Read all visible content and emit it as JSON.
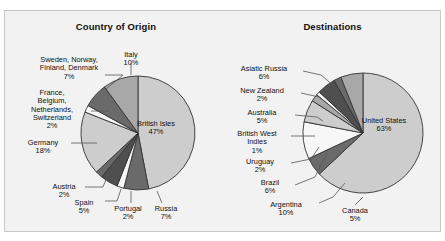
{
  "figure": {
    "background": "#f2f2f2",
    "border_color": "#c9c9c9",
    "page_background": "#ffffff"
  },
  "palette": {
    "light": "#cdcdcd",
    "mid": "#a8a8a8",
    "dark": "#6a6a6a",
    "darker": "#4f4f4f",
    "white": "#f7f7f7",
    "outline": "#333333",
    "leader": "#555555"
  },
  "charts": [
    {
      "id": "country-of-origin",
      "title": "Country of Origin",
      "chart_data": {
        "type": "pie",
        "title": "Country of Origin",
        "unit": "%",
        "start_angle_deg": 0,
        "direction": "clockwise",
        "legend": "none",
        "categories": [
          "British Isles",
          "Russia",
          "Portugal",
          "Spain",
          "Austria",
          "Germany",
          "France, Belgium, Netherlands, Switzerland",
          "Sweden, Norway, Finland, Denmark",
          "Italy"
        ],
        "values": [
          47,
          7,
          2,
          5,
          2,
          18,
          2,
          7,
          10
        ],
        "labels": [
          "British Isles\n47%",
          "Russia\n7%",
          "Portugal\n2%",
          "Spain\n5%",
          "Austria\n2%",
          "Germany\n18%",
          "France,\nBelgium,\nNetherlands,\nSwitzerland\n2%",
          "Sweden, Norway,\nFinland, Denmark\n7%",
          "Italy\n10%"
        ],
        "colors": [
          "#cdcdcd",
          "#6a6a6a",
          "#f7f7f7",
          "#4f4f4f",
          "#6a6a6a",
          "#cdcdcd",
          "#f7f7f7",
          "#6a6a6a",
          "#a8a8a8"
        ]
      },
      "slice_labels": [
        {
          "name": "british-isles",
          "text": "British Isles\n47%"
        },
        {
          "name": "russia",
          "text": "Russia\n7%"
        },
        {
          "name": "portugal",
          "text": "Portugal\n2%"
        },
        {
          "name": "spain",
          "text": "Spain\n5%"
        },
        {
          "name": "austria",
          "text": "Austria\n2%"
        },
        {
          "name": "germany",
          "text": "Germany\n18%"
        },
        {
          "name": "france-belgium-netherlands-switzerland",
          "text": "France,\nBelgium,\nNetherlands,\nSwitzerland\n2%"
        },
        {
          "name": "sweden-norway-finland-denmark",
          "text": "Sweden, Norway,\nFinland, Denmark\n7%"
        },
        {
          "name": "italy",
          "text": "Italy\n10%"
        }
      ]
    },
    {
      "id": "destinations",
      "title": "Destinations",
      "chart_data": {
        "type": "pie",
        "title": "Destinations",
        "unit": "%",
        "start_angle_deg": 0,
        "direction": "clockwise",
        "legend": "none",
        "categories": [
          "United States",
          "Canada",
          "Argentina",
          "Brazil",
          "Uruguay",
          "British West Indies",
          "Australia",
          "New Zealand",
          "Asiatic Russia"
        ],
        "values": [
          63,
          5,
          10,
          6,
          2,
          1,
          5,
          2,
          6
        ],
        "labels": [
          "United States\n63%",
          "Canada\n5%",
          "Argentina\n10%",
          "Brazil\n6%",
          "Uruguay\n2%",
          "British West\nIndies\n1%",
          "Australia\n5%",
          "New Zealand\n2%",
          "Asiatic Russia\n6%"
        ],
        "colors": [
          "#cdcdcd",
          "#6a6a6a",
          "#f7f7f7",
          "#cdcdcd",
          "#a8a8a8",
          "#f7f7f7",
          "#4f4f4f",
          "#6a6a6a",
          "#a8a8a8"
        ]
      },
      "slice_labels": [
        {
          "name": "united-states",
          "text": "United States\n63%"
        },
        {
          "name": "canada",
          "text": "Canada\n5%"
        },
        {
          "name": "argentina",
          "text": "Argentina\n10%"
        },
        {
          "name": "brazil",
          "text": "Brazil\n6%"
        },
        {
          "name": "uruguay",
          "text": "Uruguay\n2%"
        },
        {
          "name": "british-west-indies",
          "text": "British West\nIndies\n1%"
        },
        {
          "name": "australia",
          "text": "Australia\n5%"
        },
        {
          "name": "new-zealand",
          "text": "New Zealand\n2%"
        },
        {
          "name": "asiatic-russia",
          "text": "Asiatic Russia\n6%"
        }
      ]
    }
  ]
}
